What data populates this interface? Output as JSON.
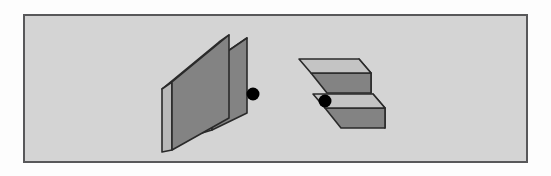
{
  "panel": {
    "background_color": "#d4d4d4",
    "outer_background_color": "#fdfdfd",
    "border_color": "#58585a",
    "frame": {
      "x": 23,
      "y": 14,
      "width": 505,
      "height": 149
    }
  },
  "palette": {
    "face_front_dark": "#838383",
    "face_side_light": "#b9b9b9",
    "face_top_light": "#c4c4c4",
    "face_inner_mid": "#9a9a9a",
    "outline": "#2a2a2a",
    "marker": "#000000"
  },
  "figures": [
    {
      "id": "left-figure",
      "name": "left-3d-object",
      "description": "Pair of parallel rectangular slabs seen edge-on, leaning up to the right",
      "marker": {
        "label": "reference-dot",
        "cx": 253,
        "cy": 94,
        "r": 6.5,
        "color": "#000000"
      },
      "slab_a": {
        "front_face": "172,82 229,35 229,118 172,150",
        "left_face": "162,89 172,82 172,150 162,152",
        "top_face": "162,89 219,42 229,35 172,82"
      },
      "slab_b": {
        "front_face": "212,62 247,38 247,113 212,130",
        "left_face": "202,69 212,62 212,130 202,133",
        "top_face": "202,69 237,45 247,38 212,62"
      }
    },
    {
      "id": "right-figure",
      "name": "right-3d-object",
      "description": "Same slab pair rotated roughly ninety degrees, seen from above-left",
      "marker": {
        "label": "reference-dot",
        "cx": 325,
        "cy": 101,
        "r": 6.5,
        "color": "#000000"
      },
      "slab_a": {
        "top_face": "299,59 359,59 371,73 311,73",
        "front_face": "311,73 371,73 371,93 327,93",
        "side_face": "359,59 371,73 371,93 359,79"
      },
      "slab_b": {
        "top_face": "313,94 373,94 385,108 325,108",
        "front_face": "325,108 385,108 385,128 341,128",
        "side_face": "373,94 385,108 385,128 373,114"
      }
    }
  ]
}
